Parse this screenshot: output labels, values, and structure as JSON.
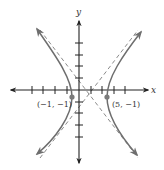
{
  "diagram": {
    "type": "hyperbola-graph",
    "axes": {
      "x_label": "x",
      "y_label": "y",
      "origin_px": [
        79,
        90
      ],
      "unit_px": 11.6,
      "x_ticks_px": [
        32,
        43,
        55,
        67,
        91,
        102,
        114,
        125
      ],
      "y_ticks_px": [
        43,
        55,
        66,
        78,
        102,
        113,
        125,
        137
      ]
    },
    "vertices": [
      {
        "label": "(−1, −1)",
        "px": [
          72,
          97
        ]
      },
      {
        "label": "(5, −1)",
        "px": [
          107,
          97
        ]
      }
    ],
    "center_px": [
      89.5,
      97
    ],
    "colors": {
      "axis": "#222222",
      "curve": "#6e6e6e",
      "asymptote": "#8a8a8a",
      "vertex_dot": "#7a7a7a"
    }
  }
}
